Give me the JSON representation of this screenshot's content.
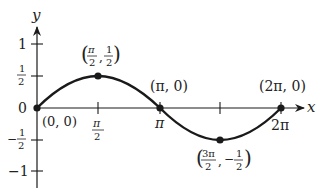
{
  "diagram": {
    "function": "y = 0.5*sin(x)",
    "domain": [
      0,
      6.2832
    ],
    "colors": {
      "curve": "#1a1a1a",
      "axis": "#1a1a1a",
      "text": "#222222",
      "background": "#ffffff"
    },
    "axes": {
      "x_label": "x",
      "y_label": "y",
      "x_ticks": [
        {
          "value": 1.5708,
          "label_num": "π",
          "label_den": "2",
          "fraction": true
        },
        {
          "value": 3.1416,
          "label": "π",
          "fraction": false
        },
        {
          "value": 4.7124,
          "label": "",
          "fraction": false
        },
        {
          "value": 6.2832,
          "label": "2π",
          "fraction": false
        }
      ],
      "y_ticks": [
        {
          "value": 1,
          "label": "1",
          "fraction": false
        },
        {
          "value": 0.5,
          "label_num": "1",
          "label_den": "2",
          "sign": "",
          "fraction": true
        },
        {
          "value": 0,
          "label": "0",
          "fraction": false
        },
        {
          "value": -0.5,
          "label_num": "1",
          "label_den": "2",
          "sign": "−",
          "fraction": true
        },
        {
          "value": -1,
          "label": "−1",
          "fraction": false
        }
      ]
    },
    "points": [
      {
        "x": 0,
        "y": 0,
        "label": "(0, 0)"
      },
      {
        "x": 1.5708,
        "y": 0.5,
        "label": "(π/2, 1/2)"
      },
      {
        "x": 3.1416,
        "y": 0,
        "label": "(π, 0)"
      },
      {
        "x": 4.7124,
        "y": -0.5,
        "label": "(3π/2, −1/2)"
      },
      {
        "x": 6.2832,
        "y": 0,
        "label": "(2π, 0)"
      }
    ],
    "labels": {
      "origin": "(0, 0)",
      "pi": "(π, 0)",
      "two_pi": "(2π, 0)",
      "x_tick_pi": "π",
      "x_tick_2pi": "2π",
      "y_tick_1": "1",
      "y_tick_0": "0",
      "y_tick_neg1": "−1",
      "one": "1",
      "two": "2",
      "three_pi": "3π",
      "pi_sym": "π",
      "minus": "−",
      "comma": ",",
      "lparen": "(",
      "rparen": ")"
    }
  }
}
